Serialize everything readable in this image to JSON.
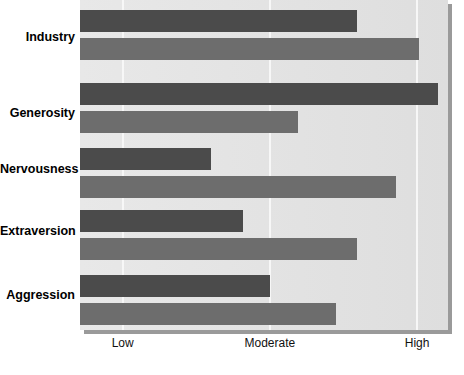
{
  "chart_data": {
    "type": "bar",
    "orientation": "horizontal",
    "title": "",
    "subtitle": "",
    "xlabel": "Strength of trait",
    "ylabel": "",
    "categories": [
      "Industry",
      "Generosity",
      "Nervousness",
      "Extraversion",
      "Aggression"
    ],
    "xticks": [
      {
        "label": "Low",
        "value": 1
      },
      {
        "label": "Moderate",
        "value": 2
      },
      {
        "label": "High",
        "value": 3
      }
    ],
    "xlim": [
      0.71,
      3.21
    ],
    "grid": "vertical-only",
    "legend": "none",
    "series": [
      {
        "name": "series-1",
        "color": "#4b4b4b",
        "values": [
          2.59,
          3.14,
          1.6,
          1.82,
          2.0
        ]
      },
      {
        "name": "series-2",
        "color": "#6d6d6d",
        "values": [
          3.01,
          2.19,
          2.86,
          2.59,
          2.45
        ]
      }
    ],
    "colors": {
      "series_1": "#4b4b4b",
      "series_2": "#6d6d6d",
      "plot_background": "#e4e4e4",
      "gridline": "#f7f7f7",
      "page_background": "#ffffff",
      "text": "#000000"
    }
  },
  "axis": {
    "title": "Strength of trait",
    "tick_low": "Low",
    "tick_moderate": "Moderate",
    "tick_high": "High"
  },
  "categories": {
    "industry": "Industry",
    "generosity": "Generosity",
    "nervousness": "Nervousness",
    "extraversion": "Extraversion",
    "aggression": "Aggression"
  }
}
